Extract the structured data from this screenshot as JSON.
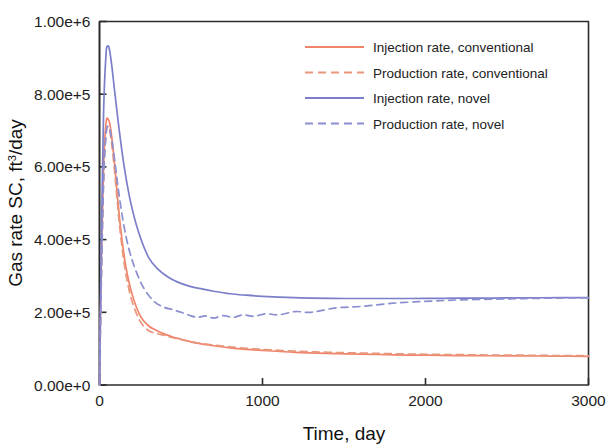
{
  "chart_data": {
    "type": "line",
    "title": "",
    "xlabel": "Time, day",
    "ylabel": "Gas rate SC, ft3/day",
    "ylabel_main": "Gas rate SC, ft",
    "ylabel_sup": "3",
    "ylabel_tail": "/day",
    "xlim": [
      0,
      3000
    ],
    "ylim": [
      0,
      1000000
    ],
    "xticks": [
      0,
      1000,
      2000,
      3000
    ],
    "xtick_labels": [
      "0",
      "1000",
      "2000",
      "3000"
    ],
    "yticks": [
      0,
      200000,
      400000,
      600000,
      800000,
      1000000
    ],
    "ytick_labels": [
      "0.00e+0",
      "2.00e+5",
      "4.00e+5",
      "6.00e+5",
      "8.00e+5",
      "1.00e+6"
    ],
    "grid": false,
    "legend_position": "upper right",
    "colors": {
      "conventional": "#f0846b",
      "novel": "#8b8ed0",
      "axis": "#2b2b2b",
      "text": "#1d1d1d"
    },
    "series": [
      {
        "name": "Injection rate, conventional",
        "key": "injection_conventional",
        "color": "#f0846b",
        "dash": "solid",
        "x": [
          0,
          10,
          25,
          40,
          55,
          70,
          90,
          110,
          130,
          160,
          200,
          250,
          300,
          350,
          400,
          450,
          500,
          600,
          700,
          800,
          900,
          1000,
          1200,
          1400,
          1600,
          1800,
          2000,
          2200,
          2400,
          2600,
          2800,
          3000
        ],
        "y": [
          0,
          300000,
          600000,
          720000,
          730000,
          700000,
          620000,
          520000,
          430000,
          330000,
          250000,
          190000,
          163000,
          150000,
          140000,
          132000,
          126000,
          115000,
          108000,
          102000,
          98000,
          95000,
          90000,
          87000,
          85000,
          83000,
          82000,
          81000,
          80500,
          80000,
          79500,
          79000
        ]
      },
      {
        "name": "Production rate, conventional",
        "key": "production_conventional",
        "color": "#e8977c",
        "dash": "dashed",
        "x": [
          0,
          10,
          25,
          40,
          55,
          70,
          90,
          110,
          130,
          160,
          200,
          250,
          300,
          350,
          400,
          450,
          500,
          600,
          700,
          800,
          900,
          1000,
          1200,
          1400,
          1600,
          1800,
          2000,
          2200,
          2400,
          2600,
          2800,
          3000
        ],
        "y": [
          0,
          270000,
          560000,
          690000,
          710000,
          680000,
          600000,
          500000,
          410000,
          310000,
          230000,
          175000,
          150000,
          142000,
          136000,
          130000,
          125000,
          116000,
          110000,
          105000,
          101000,
          98000,
          93000,
          90000,
          88000,
          86000,
          84500,
          83500,
          82500,
          82000,
          81000,
          80500
        ]
      },
      {
        "name": "Injection rate, novel",
        "key": "injection_novel",
        "color": "#7b7fc9",
        "dash": "solid",
        "x": [
          0,
          10,
          25,
          40,
          50,
          60,
          75,
          95,
          120,
          150,
          190,
          240,
          300,
          360,
          420,
          480,
          550,
          620,
          700,
          800,
          900,
          1000,
          1150,
          1300,
          1500,
          1700,
          1900,
          2100,
          2300,
          2500,
          2700,
          3000
        ],
        "y": [
          0,
          350000,
          750000,
          910000,
          932000,
          925000,
          880000,
          800000,
          705000,
          605000,
          505000,
          420000,
          352000,
          318000,
          297000,
          283000,
          272000,
          265000,
          258000,
          251000,
          247000,
          244000,
          241000,
          239000,
          238000,
          238000,
          238000,
          238500,
          239000,
          239500,
          240000,
          240500
        ]
      },
      {
        "name": "Production rate, novel",
        "key": "production_novel",
        "color": "#8b8ed0",
        "dash": "dashed",
        "x": [
          0,
          10,
          25,
          40,
          55,
          70,
          90,
          115,
          145,
          180,
          220,
          270,
          330,
          390,
          450,
          500,
          550,
          600,
          650,
          700,
          760,
          820,
          880,
          950,
          1020,
          1100,
          1200,
          1300,
          1450,
          1600,
          1800,
          2000,
          2200,
          2500,
          2800,
          3000
        ],
        "y": [
          0,
          250000,
          560000,
          690000,
          712000,
          690000,
          630000,
          540000,
          450000,
          375000,
          318000,
          268000,
          232000,
          215000,
          207000,
          200000,
          192000,
          186000,
          190000,
          184000,
          191000,
          186000,
          193000,
          189000,
          196000,
          193000,
          202000,
          200000,
          212000,
          216000,
          225000,
          230000,
          234000,
          237000,
          239000,
          240000
        ]
      }
    ]
  },
  "legend": {
    "items": [
      {
        "label": "Injection rate, conventional",
        "color": "#f0846b",
        "dash": "solid"
      },
      {
        "label": "Production rate, conventional",
        "color": "#e8977c",
        "dash": "dashed"
      },
      {
        "label": "Injection rate, novel",
        "color": "#7b7fc9",
        "dash": "solid"
      },
      {
        "label": "Production rate, novel",
        "color": "#8b8ed0",
        "dash": "dashed"
      }
    ]
  }
}
